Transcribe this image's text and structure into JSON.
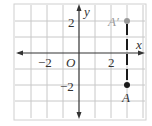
{
  "diagram": {
    "type": "coordinate-grid",
    "grid": {
      "x_min": -4,
      "x_max": 4,
      "y_min": -4,
      "y_max": 3,
      "step": 1
    },
    "axes": {
      "x_label": "x",
      "y_label": "y",
      "origin_label": "O"
    },
    "tick_labels": {
      "x_neg": "−2",
      "x_pos": "2",
      "y_pos": "2",
      "y_neg": "−2"
    },
    "points": [
      {
        "name": "A'",
        "label": "A′",
        "x": 3,
        "y": 2,
        "color": "#999999"
      },
      {
        "name": "A",
        "label": "A",
        "x": 3,
        "y": -2,
        "color": "#1a1a1a"
      }
    ],
    "segment": {
      "from": "A",
      "to": "A'",
      "style": "dashed",
      "color": "#1a1a1a"
    }
  }
}
